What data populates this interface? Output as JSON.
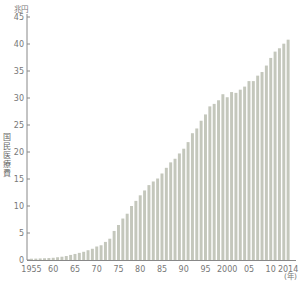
{
  "chart_data": {
    "type": "bar",
    "title": "",
    "xlabel": "(年)",
    "ylabel": "国民医療費",
    "y_unit": "兆円",
    "ylim": [
      0,
      45
    ],
    "yticks": [
      0,
      5,
      10,
      15,
      20,
      25,
      30,
      35,
      40,
      45
    ],
    "xtick_labels": [
      {
        "year": 1955,
        "label": "1955"
      },
      {
        "year": 1960,
        "label": "60"
      },
      {
        "year": 1965,
        "label": "65"
      },
      {
        "year": 1970,
        "label": "70"
      },
      {
        "year": 1975,
        "label": "75"
      },
      {
        "year": 1980,
        "label": "80"
      },
      {
        "year": 1985,
        "label": "85"
      },
      {
        "year": 1990,
        "label": "90"
      },
      {
        "year": 1995,
        "label": "95"
      },
      {
        "year": 2000,
        "label": "2000"
      },
      {
        "year": 2005,
        "label": "05"
      },
      {
        "year": 2010,
        "label": "10"
      },
      {
        "year": 2014,
        "label": "2014"
      }
    ],
    "grid": false,
    "legend": null,
    "bar_color": "#c4c7bc",
    "categories": [
      1955,
      1956,
      1957,
      1958,
      1959,
      1960,
      1961,
      1962,
      1963,
      1964,
      1965,
      1966,
      1967,
      1968,
      1969,
      1970,
      1971,
      1972,
      1973,
      1974,
      1975,
      1976,
      1977,
      1978,
      1979,
      1980,
      1981,
      1982,
      1983,
      1984,
      1985,
      1986,
      1987,
      1988,
      1989,
      1990,
      1991,
      1992,
      1993,
      1994,
      1995,
      1996,
      1997,
      1998,
      1999,
      2000,
      2001,
      2002,
      2003,
      2004,
      2005,
      2006,
      2007,
      2008,
      2009,
      2010,
      2011,
      2012,
      2013,
      2014
    ],
    "values": [
      0.24,
      0.26,
      0.29,
      0.32,
      0.36,
      0.41,
      0.51,
      0.61,
      0.74,
      0.94,
      1.12,
      1.32,
      1.52,
      1.81,
      2.08,
      2.5,
      2.73,
      3.35,
      3.94,
      5.38,
      6.48,
      7.68,
      8.57,
      10.0,
      10.95,
      11.98,
      12.88,
      13.87,
      14.54,
      15.09,
      16.02,
      17.07,
      18.08,
      18.75,
      19.73,
      20.61,
      21.83,
      23.48,
      24.36,
      25.79,
      26.96,
      28.45,
      28.91,
      29.58,
      30.7,
      30.14,
      31.1,
      30.95,
      31.54,
      32.11,
      33.13,
      33.13,
      34.14,
      34.81,
      36.01,
      37.42,
      38.59,
      39.21,
      40.06,
      40.8
    ]
  }
}
